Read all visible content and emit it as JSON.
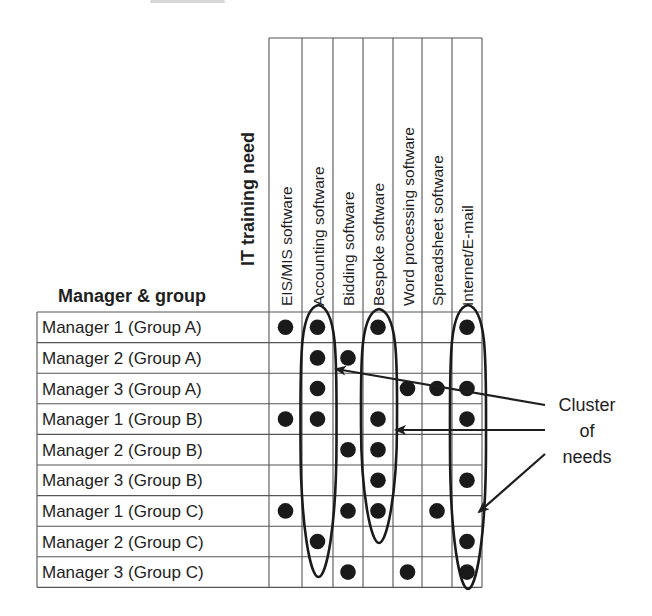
{
  "figure": {
    "row_header": "Manager & group",
    "column_header": "IT training need",
    "columns": [
      "EIS/MIS software",
      "Accounting software",
      "Bidding software",
      "Bespoke software",
      "Word processing software",
      "Spreadsheet software",
      "Internet/E-mail"
    ],
    "rows": [
      {
        "label": "Manager 1 (Group A)",
        "needs": [
          1,
          1,
          0,
          1,
          0,
          0,
          1
        ]
      },
      {
        "label": "Manager 2 (Group A)",
        "needs": [
          0,
          1,
          1,
          0,
          0,
          0,
          0
        ]
      },
      {
        "label": "Manager 3 (Group A)",
        "needs": [
          0,
          1,
          0,
          0,
          1,
          1,
          1
        ]
      },
      {
        "label": "Manager 1 (Group B)",
        "needs": [
          1,
          1,
          0,
          1,
          0,
          0,
          1
        ]
      },
      {
        "label": "Manager 2 (Group B)",
        "needs": [
          0,
          0,
          1,
          1,
          0,
          0,
          0
        ]
      },
      {
        "label": "Manager 3 (Group B)",
        "needs": [
          0,
          0,
          0,
          1,
          0,
          0,
          1
        ]
      },
      {
        "label": "Manager 1 (Group C)",
        "needs": [
          1,
          0,
          1,
          1,
          0,
          1,
          0
        ]
      },
      {
        "label": "Manager 2 (Group C)",
        "needs": [
          0,
          1,
          0,
          0,
          0,
          0,
          1
        ]
      },
      {
        "label": "Manager 3 (Group C)",
        "needs": [
          0,
          0,
          1,
          0,
          1,
          0,
          1
        ]
      }
    ],
    "clusters": [
      {
        "column": "Accounting software",
        "top_y": 305,
        "bottom_y": 577
      },
      {
        "column": "Bespoke software",
        "top_y": 309,
        "bottom_y": 543
      },
      {
        "column": "Internet/E-mail",
        "top_y": 305,
        "bottom_y": 589
      }
    ],
    "annotation": {
      "lines": [
        "Cluster",
        "of",
        "needs"
      ]
    }
  }
}
